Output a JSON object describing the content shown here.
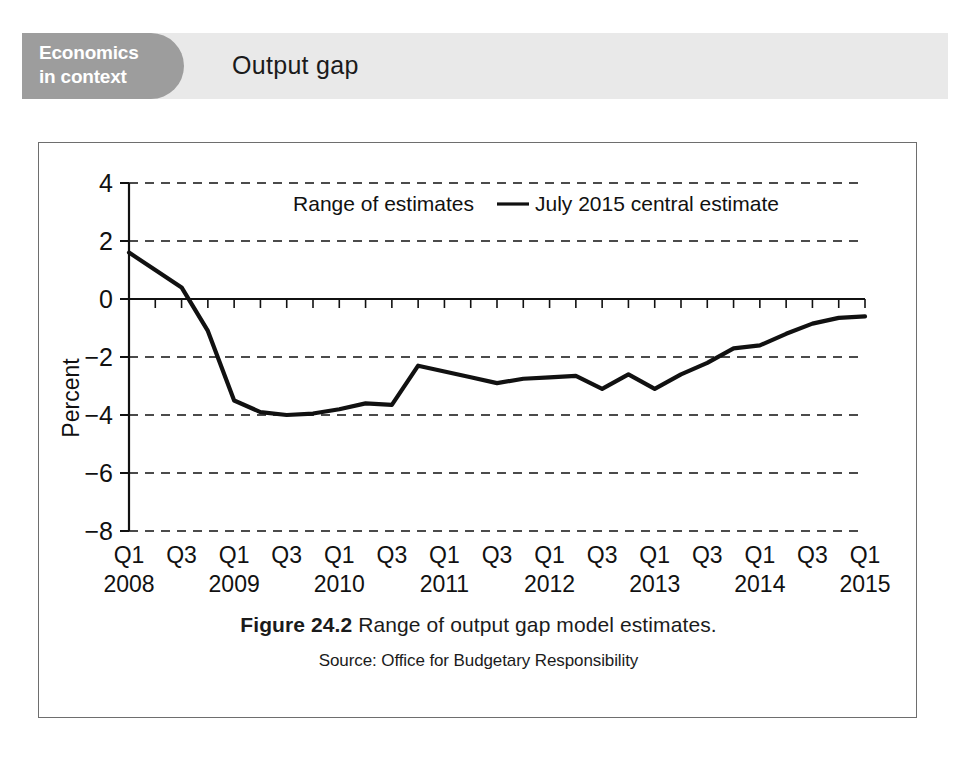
{
  "header": {
    "badge_line1": "Economics",
    "badge_line2": "in context",
    "title": "Output gap",
    "badge_color": "#9d9d9d",
    "band_color": "#e9e9e9"
  },
  "caption": {
    "figure_number": "Figure 24.2",
    "figure_text": "Range of output gap model estimates.",
    "source": "Source: Office for Budgetary Responsibility"
  },
  "legend": {
    "range_label": "Range of estimates",
    "line_label": "July 2015 central estimate",
    "line_color": "#111111"
  },
  "chart_data": {
    "type": "line",
    "title": "Output gap",
    "xlabel": "",
    "ylabel": "Percent",
    "ylim": [
      -8,
      4
    ],
    "yticks": [
      4,
      2,
      0,
      -2,
      -4,
      -6,
      -8
    ],
    "yticklabels": [
      "4",
      "2",
      "0",
      "−2",
      "−4",
      "−6",
      "−8"
    ],
    "grid": "horizontal-dashed",
    "legend_position": "top-center",
    "xticklabels": [
      "Q1",
      "Q3",
      "Q1",
      "Q3",
      "Q1",
      "Q3",
      "Q1",
      "Q3",
      "Q1",
      "Q3",
      "Q1",
      "Q3",
      "Q1",
      "Q3",
      "Q1"
    ],
    "xyear_labels": [
      {
        "index": 0,
        "year": "2008"
      },
      {
        "index": 2,
        "year": "2009"
      },
      {
        "index": 4,
        "year": "2010"
      },
      {
        "index": 6,
        "year": "2011"
      },
      {
        "index": 8,
        "year": "2012"
      },
      {
        "index": 10,
        "year": "2013"
      },
      {
        "index": 12,
        "year": "2014"
      },
      {
        "index": 14,
        "year": "2015"
      }
    ],
    "x": [
      "Q1 2008",
      "Q2 2008",
      "Q3 2008",
      "Q4 2008",
      "Q1 2009",
      "Q2 2009",
      "Q3 2009",
      "Q4 2009",
      "Q1 2010",
      "Q2 2010",
      "Q3 2010",
      "Q4 2010",
      "Q1 2011",
      "Q2 2011",
      "Q3 2011",
      "Q4 2011",
      "Q1 2012",
      "Q2 2012",
      "Q3 2012",
      "Q4 2012",
      "Q1 2013",
      "Q2 2013",
      "Q3 2013",
      "Q4 2013",
      "Q1 2014",
      "Q2 2014",
      "Q3 2014",
      "Q4 2014",
      "Q1 2015"
    ],
    "series": [
      {
        "name": "July 2015 central estimate",
        "color": "#111111",
        "values": [
          1.6,
          1.0,
          0.4,
          -1.1,
          -3.5,
          -3.9,
          -4.0,
          -3.95,
          -3.8,
          -3.6,
          -3.65,
          -2.3,
          -2.5,
          -2.7,
          -2.9,
          -2.75,
          -2.7,
          -2.65,
          -3.1,
          -2.6,
          -3.1,
          -2.6,
          -2.2,
          -1.7,
          -1.6,
          -1.2,
          -0.85,
          -0.65,
          -0.6
        ]
      }
    ]
  }
}
